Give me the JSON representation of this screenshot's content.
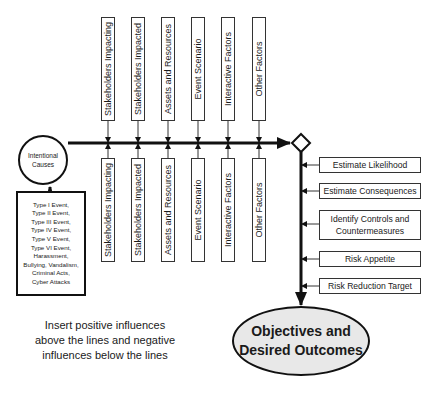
{
  "diagram": {
    "cause": {
      "label_line1": "Intentional",
      "label_line2": "Causes"
    },
    "cause_types": [
      "Type I Event,",
      "Type II Event,",
      "Type III Event,",
      "Type IV Event,",
      "Type V Event,",
      "Type VI Event,",
      "Harassment,",
      "Bullying, Vandalism,",
      "Criminal Acts,",
      "Cyber Attacks"
    ],
    "positive_factors": [
      {
        "label": "Stakeholders Impacting"
      },
      {
        "label": "Stakeholders Impacted"
      },
      {
        "label": "Assets and Resources"
      },
      {
        "label": "Event Scenario"
      },
      {
        "label": "Interactive Factors"
      },
      {
        "label": "Other Factors"
      }
    ],
    "negative_factors": [
      {
        "label": "Stakeholders Impacting"
      },
      {
        "label": "Stakeholders Impacted"
      },
      {
        "label": "Assets and Resources"
      },
      {
        "label": "Event Scenario"
      },
      {
        "label": "Interactive Factors"
      },
      {
        "label": "Other Factors"
      }
    ],
    "assessment_steps": [
      {
        "label": "Estimate Likelihood"
      },
      {
        "label": "Estimate Consequences"
      },
      {
        "label": "Identify Controls and Countermeasures"
      },
      {
        "label": "Risk Appetite"
      },
      {
        "label": "Risk Reduction Target"
      }
    ],
    "outcome": {
      "line1": "Objectives and",
      "line2": "Desired Outcomes"
    },
    "note": "Insert positive influences above the lines and negative influences below the lines"
  }
}
